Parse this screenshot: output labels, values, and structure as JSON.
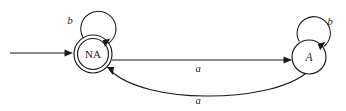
{
  "figure": {
    "kind": "finite-state-automaton-diagram",
    "background_color": "#ffffff",
    "stroke_color": "#1a1a1a",
    "width": 346,
    "height": 111
  },
  "states": [
    {
      "id": "NA",
      "label": "NA",
      "shape": "double-circle",
      "is_start": true,
      "is_accepting": true,
      "cx": 93,
      "cy": 54,
      "r_outer": 19,
      "r_inner": 15.5,
      "italic": false
    },
    {
      "id": "A",
      "label": "A",
      "shape": "circle",
      "is_start": false,
      "is_accepting": false,
      "cx": 309,
      "cy": 57,
      "r_outer": 17,
      "r_inner": 0,
      "italic": true
    }
  ],
  "transitions": [
    {
      "id": "na-self-b",
      "from": "NA",
      "to": "NA",
      "label": "b",
      "kind": "self-loop",
      "label_x": 70,
      "label_y": 22
    },
    {
      "id": "na-to-a",
      "from": "NA",
      "to": "A",
      "label": "a",
      "kind": "straight",
      "label_x": 198,
      "label_y": 70
    },
    {
      "id": "a-to-na",
      "from": "A",
      "to": "NA",
      "label": "a",
      "kind": "curved",
      "label_x": 198,
      "label_y": 102
    },
    {
      "id": "a-self-b",
      "from": "A",
      "to": "A",
      "label": "b",
      "kind": "self-loop",
      "label_x": 330,
      "label_y": 23
    }
  ],
  "start_arrow": {
    "id": "start-arrow",
    "label": "",
    "x_start": 10,
    "x_end": 73,
    "y": 53
  }
}
